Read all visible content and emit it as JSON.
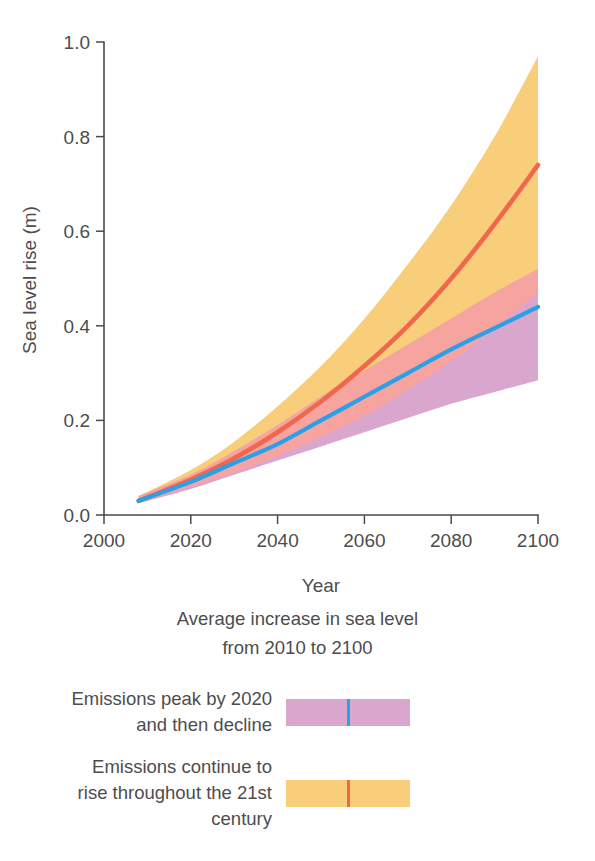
{
  "figure": {
    "background": "#ffffff"
  },
  "chart_data": {
    "type": "area",
    "title": "",
    "xlabel": "Year",
    "ylabel": "Sea level rise (m)",
    "xlim": [
      2000,
      2100
    ],
    "ylim": [
      0.0,
      1.0
    ],
    "xticks": [
      2000,
      2020,
      2040,
      2060,
      2080,
      2100
    ],
    "xtick_labels": [
      "2000",
      "2020",
      "2040",
      "2060",
      "2080",
      "2100"
    ],
    "yticks": [
      0.0,
      0.2,
      0.4,
      0.6,
      0.8,
      1.0
    ],
    "ytick_labels": [
      "0.0",
      "0.2",
      "0.4",
      "0.6",
      "0.8",
      "1.0"
    ],
    "grid": false,
    "legend_position": "below-plot",
    "x": [
      2008,
      2020,
      2030,
      2040,
      2050,
      2060,
      2070,
      2080,
      2090,
      2100
    ],
    "series": [
      {
        "name": "Emissions peak by 2020 and then decline",
        "line_color": "#29a0e8",
        "band_color": "#d9a6ce",
        "values": [
          0.03,
          0.07,
          0.11,
          0.15,
          0.2,
          0.25,
          0.3,
          0.35,
          0.395,
          0.44
        ],
        "band_lower": [
          0.025,
          0.055,
          0.085,
          0.115,
          0.145,
          0.175,
          0.205,
          0.235,
          0.26,
          0.285
        ],
        "band_upper": [
          0.04,
          0.085,
          0.135,
          0.19,
          0.25,
          0.305,
          0.36,
          0.415,
          0.47,
          0.52
        ]
      },
      {
        "name": "Emissions continue to rise throughout the 21st century",
        "line_color": "#f0674e",
        "band_color": "#f8ce7a",
        "values": [
          0.03,
          0.075,
          0.12,
          0.175,
          0.24,
          0.315,
          0.4,
          0.5,
          0.615,
          0.74
        ],
        "band_lower": [
          0.025,
          0.06,
          0.09,
          0.125,
          0.165,
          0.21,
          0.265,
          0.325,
          0.395,
          0.47
        ],
        "band_upper": [
          0.04,
          0.095,
          0.155,
          0.23,
          0.315,
          0.415,
          0.53,
          0.655,
          0.8,
          0.97
        ]
      }
    ],
    "overlap_color": "#f7a3a0"
  },
  "legend": {
    "title_lines": [
      "Average increase in sea level",
      "from 2010 to 2100"
    ],
    "entries": [
      {
        "label_lines": [
          "Emissions peak by 2020",
          "and then decline"
        ],
        "band_color": "#d9a6ce",
        "line_color": "#29a0e8",
        "swatch_name": "purple-band-with-blue-line"
      },
      {
        "label_lines": [
          "Emissions continue to",
          "rise throughout the 21st",
          "century"
        ],
        "band_color": "#f8ce7a",
        "line_color": "#f0674e",
        "swatch_name": "yellow-band-with-red-line"
      }
    ]
  },
  "bottom_clipped_text": "",
  "colors": {
    "axis": "#4a4a4a",
    "text": "#4d4d4d",
    "blue_line": "#29a0e8",
    "red_line": "#f0674e",
    "purple_band": "#d9a6ce",
    "yellow_band": "#f8ce7a",
    "overlap_band": "#f7a3a0"
  }
}
